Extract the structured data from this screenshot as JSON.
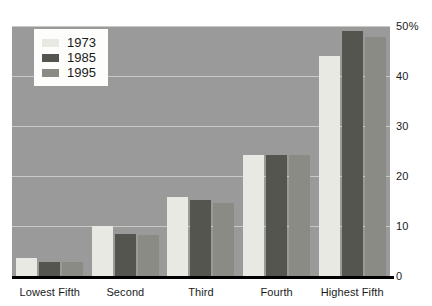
{
  "chart_data": {
    "type": "bar",
    "title": "",
    "xlabel": "",
    "ylabel": "",
    "ylim": [
      0,
      50
    ],
    "yticks": [
      {
        "value": 0,
        "label": "0"
      },
      {
        "value": 10,
        "label": "10"
      },
      {
        "value": 20,
        "label": "20"
      },
      {
        "value": 30,
        "label": "30"
      },
      {
        "value": 40,
        "label": "40"
      },
      {
        "value": 50,
        "label": "50%"
      }
    ],
    "grid": true,
    "legend_position": "top-left",
    "categories": [
      "Lowest Fifth",
      "Second",
      "Third",
      "Fourth",
      "Highest Fifth"
    ],
    "series": [
      {
        "name": "1973",
        "color": "#e9e9e4",
        "values": [
          3.6,
          10.0,
          15.8,
          24.3,
          44.0
        ]
      },
      {
        "name": "1985",
        "color": "#55554f",
        "values": [
          2.8,
          8.4,
          15.2,
          24.3,
          49.0
        ]
      },
      {
        "name": "1995",
        "color": "#8b8b85",
        "values": [
          2.8,
          8.2,
          14.6,
          24.3,
          47.8
        ]
      }
    ],
    "plot_background": "#9a9a9a",
    "gridline_color": "#c9c9c4",
    "axis_color": "#000000"
  }
}
